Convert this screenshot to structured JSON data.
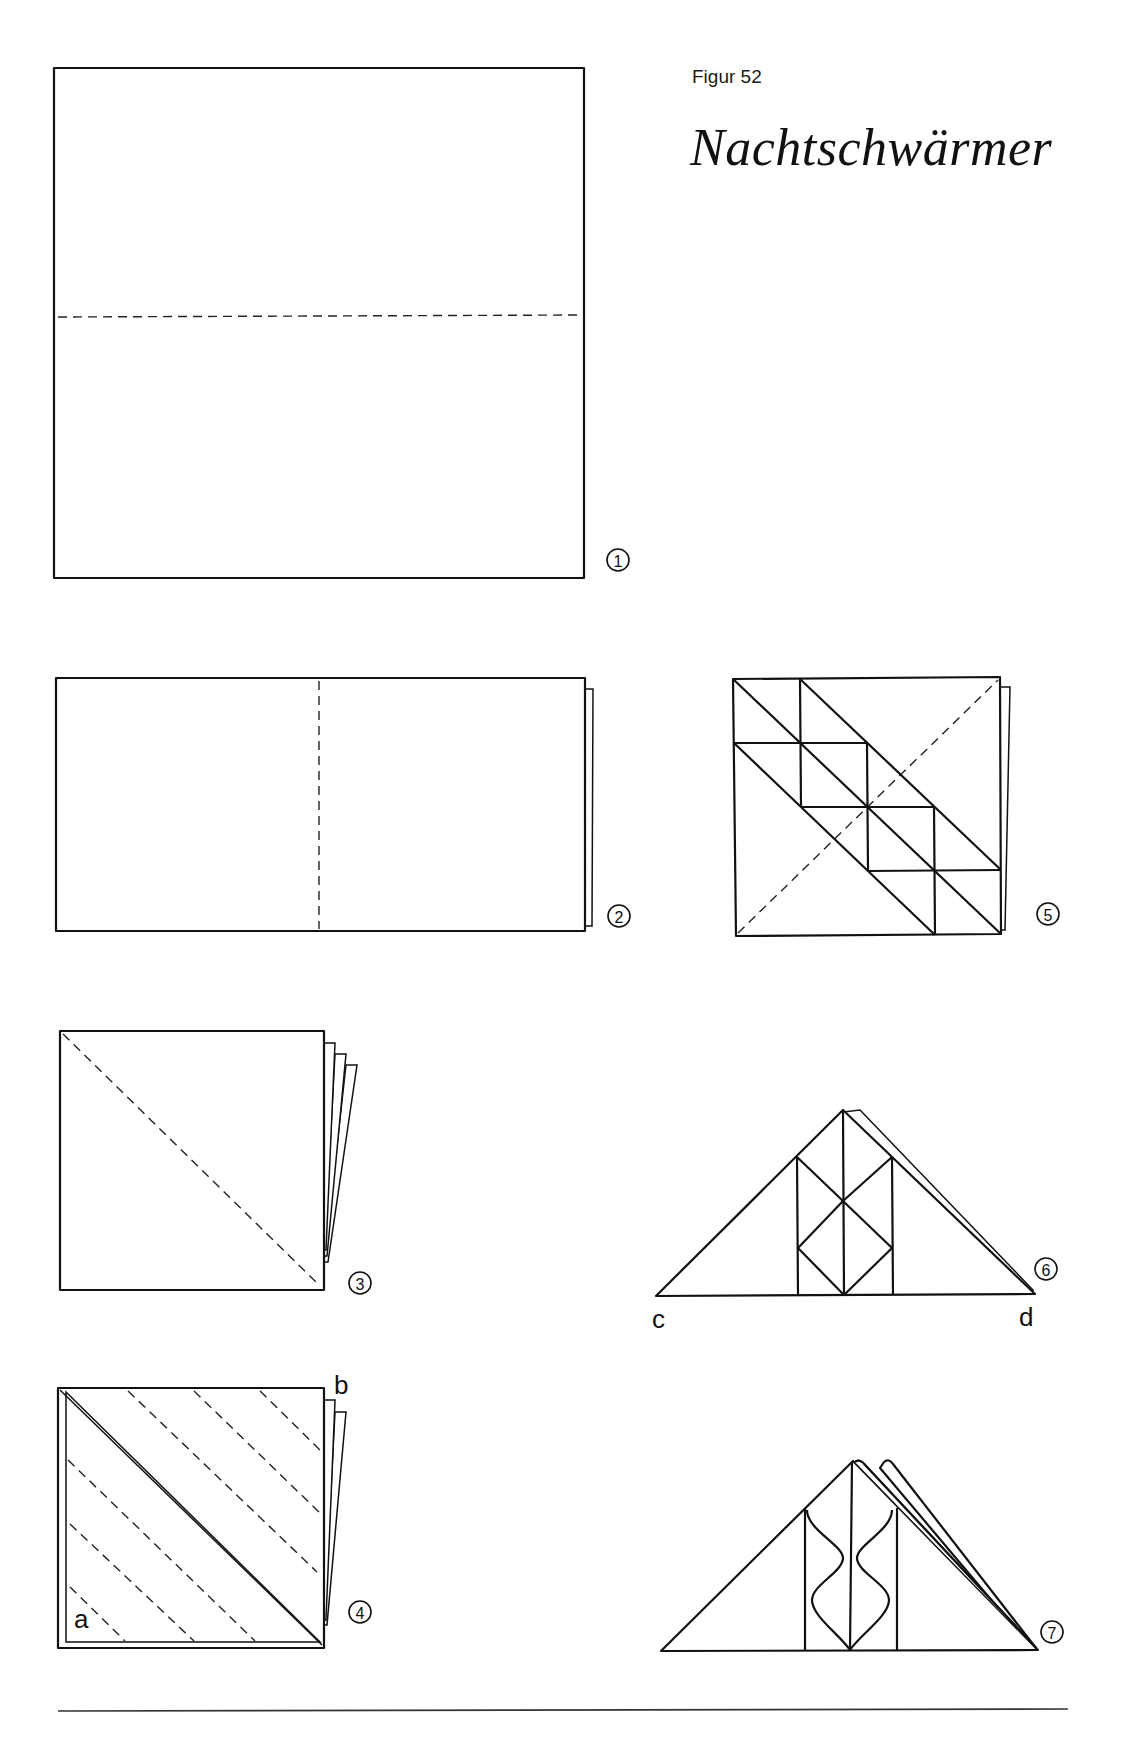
{
  "header": {
    "figure_label": "Figur 52",
    "title": "Nachtschwärmer"
  },
  "steps": [
    {
      "number": "1",
      "description": "square with horizontal dashed valley fold at middle"
    },
    {
      "number": "2",
      "description": "folded rectangle with vertical dashed fold at middle"
    },
    {
      "number": "3",
      "description": "folded square with diagonal dashed fold"
    },
    {
      "number": "4",
      "description": "triangle with parallel dashed folds",
      "labels": [
        "a",
        "b"
      ]
    },
    {
      "number": "5",
      "description": "square with grid of crease lines and dashed diagonal"
    },
    {
      "number": "6",
      "description": "triangle with diamond crease pattern",
      "labels": [
        "c",
        "d"
      ]
    },
    {
      "number": "7",
      "description": "finished moth shape with wavy folds"
    }
  ],
  "labels": {
    "a": "a",
    "b": "b",
    "c": "c",
    "d": "d"
  },
  "colors": {
    "line": "#111111",
    "background": "#ffffff"
  }
}
